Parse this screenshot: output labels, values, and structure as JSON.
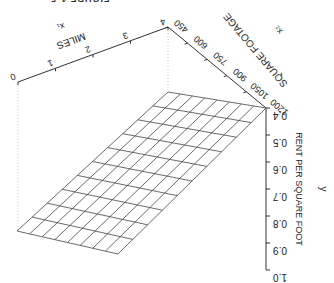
{
  "figure": {
    "caption_partial": "FIGURE 1-5",
    "orientation": "rotated 180 degrees"
  },
  "chart_data": {
    "type": "surface3d",
    "title": "",
    "x1_axis": {
      "label": "MILES",
      "symbol": "x1",
      "ticks": [
        "0",
        "1",
        "2",
        "3",
        "4"
      ],
      "range": [
        0,
        4
      ]
    },
    "x2_axis": {
      "label": "SQUARE FOOTAGE",
      "symbol": "x2",
      "ticks": [
        "450",
        "600",
        "750",
        "900",
        "1050",
        "1200"
      ],
      "range": [
        450,
        1200
      ]
    },
    "y_axis": {
      "label": "RENT PER SQUARE FOOT",
      "symbol": "y",
      "ticks": [
        "0.4",
        "0.5",
        "0.6",
        "0.7",
        "0.8",
        "0.9",
        "1.0"
      ],
      "range": [
        0.4,
        1.0
      ]
    },
    "surface": {
      "description": "Planar mesh: rent per square foot decreases as miles and square footage increase",
      "grid": {
        "x1_divisions": 10,
        "x2_divisions": 8
      },
      "corners": [
        {
          "x1": 0,
          "x2": 450,
          "y": 1.0
        },
        {
          "x1": 4,
          "x2": 450,
          "y": 0.63
        },
        {
          "x1": 4,
          "x2": 1200,
          "y": 0.4
        },
        {
          "x1": 0,
          "x2": 1200,
          "y": 0.8
        }
      ]
    },
    "grid": false,
    "legend": null
  }
}
